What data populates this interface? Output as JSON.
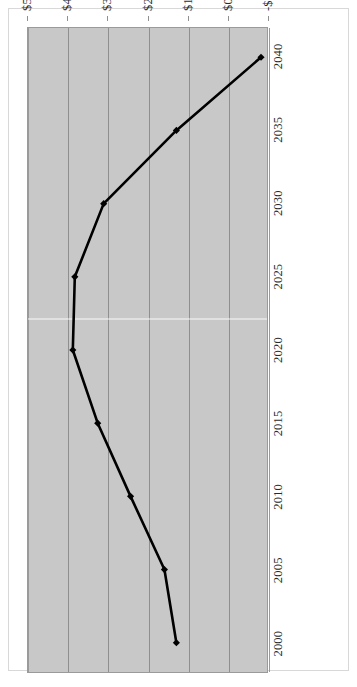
{
  "chart_data": {
    "type": "line",
    "title": "",
    "subtitle": "",
    "xlabel": "",
    "ylabel": "",
    "orientation": "rotated-90-ccw",
    "grid": true,
    "legend": "none",
    "plot_background_color": "#c8c8c8",
    "line_color": "#000000",
    "marker": "diamond",
    "x": [
      2000,
      2005,
      2010,
      2015,
      2020,
      2025,
      2030,
      2035,
      2040
    ],
    "xtick_labels": [
      "2000",
      "2005",
      "2010",
      "2015",
      "2020",
      "2025",
      "2030",
      "2035",
      "2040"
    ],
    "xlim": [
      1998,
      2042
    ],
    "ylim": [
      -1000,
      5000
    ],
    "ytick_values": [
      5000,
      4000,
      3000,
      2000,
      1000,
      0,
      -1000
    ],
    "ytick_labels": [
      "$5,000",
      "$4,000",
      "$3,000",
      "$2,000",
      "$1,000",
      "$0",
      "-$1,000"
    ],
    "series": [
      {
        "name": "Series 1",
        "values": [
          1275,
          1575,
          2425,
          3250,
          3875,
          3825,
          3100,
          1275,
          -850
        ]
      }
    ]
  }
}
